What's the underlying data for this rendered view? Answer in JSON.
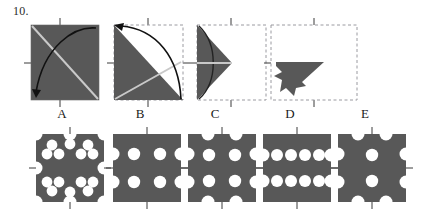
{
  "question": {
    "number": "10."
  },
  "colors": {
    "shape_fill": "#585858",
    "paper_outline": "#9a9aa0",
    "fold_line": "#c9c9c9",
    "arrow": "#111111",
    "tick": "#3a3a3a",
    "label_text": "#1a1a1a",
    "background": "#ffffff"
  },
  "puzzle": {
    "type": "paper-folding-punch",
    "prompt_number": "10.",
    "fold_steps": [
      {
        "id": "step-1",
        "name": "square-fold-diagonal",
        "description": "Full square sheet, shaded; diagonal fold line from top-left to bottom-right; curved arrow shows top-right corner folding down to bottom-left.",
        "paper": "solid-square",
        "fold_line": "diagonal-tl-br",
        "arrow": "curve-from-top-right-to-bottom-left",
        "dashed_outline": false
      },
      {
        "id": "step-2",
        "name": "triangle-fold-vertical",
        "description": "Lower-left triangle remains; dashed outline marks the original square; curved arrow shows the right portion folding to the left.",
        "paper": "lower-left-triangle",
        "fold_line": "diagonal-bl-tr",
        "arrow": "curve-from-bottom-right-to-top-left",
        "dashed_outline": true
      },
      {
        "id": "step-3",
        "name": "left-triangle-quarter",
        "description": "Left-pointing triangle (quarter sheet) against dashed square outline; horizontal mid fold line shown.",
        "paper": "left-triangle",
        "fold_line": "horizontal-mid",
        "arrow": "none",
        "dashed_outline": true
      },
      {
        "id": "step-4",
        "name": "punched-folded-shape",
        "description": "Folded packet after holes are punched; notched silhouette sits in the lower-left of the dashed square outline.",
        "paper": "punched-packet",
        "fold_line": "none",
        "arrow": "none",
        "dashed_outline": true
      }
    ],
    "options": [
      {
        "id": "option-a",
        "label": "A",
        "hole_count_interior": 12,
        "description": "Square sheet with many holes scattered around, plus half-holes on all four edges and quarter-holes at the corners."
      },
      {
        "id": "option-b",
        "label": "B",
        "hole_count_interior": 4,
        "description": "Square sheet with four interior holes in a 2x2 grid and half-holes only on the left and right edges."
      },
      {
        "id": "option-c",
        "label": "C",
        "hole_count_interior": 4,
        "description": "Square sheet with four interior holes in a 2x2 grid and half-holes on all four edges."
      },
      {
        "id": "option-d",
        "label": "D",
        "hole_count_interior": 8,
        "description": "Square sheet with two horizontal rows of four holes each and half-holes on the left and right edges."
      },
      {
        "id": "option-e",
        "label": "E",
        "hole_count_interior": 2,
        "description": "Square sheet with two interior holes stacked vertically in the centre and half-holes on all four edges."
      }
    ]
  }
}
